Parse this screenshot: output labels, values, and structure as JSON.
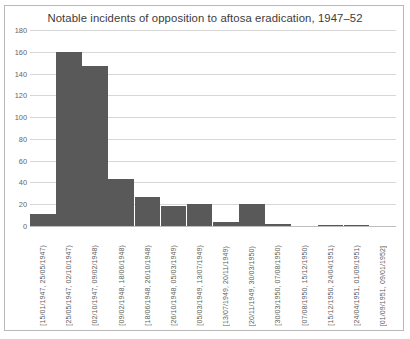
{
  "chart_data": {
    "type": "bar",
    "title": "Notable incidents of opposition to aftosa eradication, 1947–52",
    "xlabel": "",
    "ylabel": "",
    "ylim": [
      0,
      180
    ],
    "ytick_step": 20,
    "grid": true,
    "legend": "none",
    "bar_color": "#595959",
    "grid_color": "#d7d7d7",
    "frame_color": "#b9b9b9",
    "title_color": "#3c3c3c",
    "tick_label_color": "#5d5d5d",
    "categories": [
      "[15/01/1947, 25/05/1947)",
      "[25/05/1947, 02/10/1947)",
      "[02/10/1947, 09/02/1948)",
      "[09/02/1948, 18/06/1948)",
      "[18/06/1948, 26/10/1948)",
      "[26/10/1948, 05/03/1949)",
      "[05/03/1949, 13/07/1949)",
      "[13/07/1949, 20/11/1949)",
      "[20/11/1949, 30/03/1950)",
      "[30/03/1950, 07/08/1950)",
      "[07/08/1950, 15/12/1950)",
      "[15/12/1950, 24/04/1951)",
      "[24/04/1951, 01/09/1951)",
      "[01/09/1951, 09/01/1952]"
    ],
    "values": [
      11,
      160,
      147,
      43,
      27,
      18,
      20,
      4,
      20,
      2,
      0,
      1,
      1,
      0
    ],
    "yticks": [
      0,
      20,
      40,
      60,
      80,
      100,
      120,
      140,
      160,
      180
    ],
    "ytick_labels": [
      "0",
      "20",
      "40",
      "60",
      "80",
      "100",
      "120",
      "140",
      "160",
      "180"
    ]
  }
}
